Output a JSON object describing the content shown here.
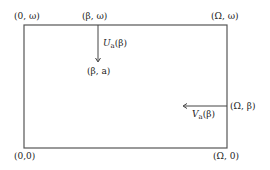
{
  "corners": {
    "top_left": "(0, ω)",
    "top_mid": "(β, ω)",
    "top_right": "(Ω, ω)",
    "bottom_left": "(0,0)",
    "bottom_right": "(Ω, 0)"
  },
  "points": {
    "interior_point": "(β, a)",
    "right_point": "(Ω, β)"
  },
  "arrows": {
    "vertical": {
      "letter": "U",
      "subscript": "a",
      "arg": "(β)"
    },
    "horizontal": {
      "letter": "V",
      "subscript": "a",
      "arg": "(β)"
    }
  },
  "colors": {
    "line": "#555555",
    "text": "#222222"
  }
}
